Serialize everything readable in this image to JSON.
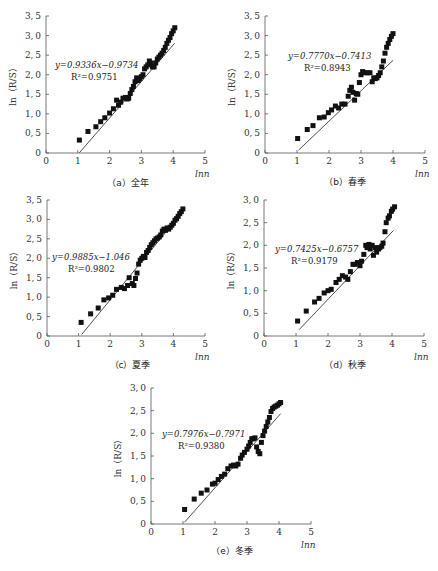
{
  "chart_data": [
    {
      "type": "scatter",
      "id": "a",
      "caption": "（a）全年",
      "xlabel": "lnn",
      "ylabel": "ln（R/S）",
      "xlim": [
        0,
        5
      ],
      "ylim": [
        0,
        3.5
      ],
      "xticks": [
        "0",
        "1",
        "2",
        "3",
        "4",
        "5"
      ],
      "yticks": [
        "0",
        "0.5",
        "1.0",
        "1.5",
        "2.0",
        "2.5",
        "3.0",
        "3.5"
      ],
      "equation": "y=0.9336x−0.9734",
      "r2": "R²=0.9751",
      "fit": {
        "slope": 0.9336,
        "intercept": -0.9734,
        "x_range": [
          1.05,
          4.05
        ]
      },
      "x": [
        1.05,
        1.32,
        1.57,
        1.72,
        1.85,
        2.0,
        2.12,
        2.22,
        2.28,
        2.35,
        2.42,
        2.5,
        2.55,
        2.6,
        2.65,
        2.7,
        2.75,
        2.8,
        2.85,
        2.9,
        2.95,
        3.0,
        3.05,
        3.1,
        3.15,
        3.2,
        3.25,
        3.3,
        3.35,
        3.4,
        3.45,
        3.5,
        3.55,
        3.6,
        3.65,
        3.7,
        3.75,
        3.8,
        3.85,
        3.9,
        3.95,
        4.0,
        4.05
      ],
      "y": [
        0.33,
        0.55,
        0.67,
        0.8,
        0.9,
        1.02,
        1.13,
        1.35,
        1.22,
        1.3,
        1.4,
        1.42,
        1.38,
        1.4,
        1.52,
        1.62,
        1.7,
        1.82,
        1.92,
        1.85,
        1.9,
        1.95,
        2.0,
        2.15,
        2.2,
        2.25,
        2.35,
        2.3,
        2.2,
        2.2,
        2.3,
        2.4,
        2.45,
        2.5,
        2.55,
        2.62,
        2.7,
        2.8,
        2.88,
        2.95,
        3.05,
        3.12,
        3.2
      ]
    },
    {
      "type": "scatter",
      "id": "b",
      "caption": "（b）春季",
      "xlabel": "lnn",
      "ylabel": "ln（R/S）",
      "xlim": [
        0,
        5
      ],
      "ylim": [
        0,
        3.5
      ],
      "xticks": [
        "0",
        "1",
        "2",
        "3",
        "4",
        "5"
      ],
      "yticks": [
        "0",
        "0.5",
        "1.0",
        "1.5",
        "2.0",
        "2.5",
        "3.0",
        "3.5"
      ],
      "equation": "y=0.7770x−0.7413",
      "r2": "R²=0.8943",
      "fit": {
        "slope": 0.777,
        "intercept": -0.7413,
        "x_range": [
          1.05,
          4.0
        ]
      },
      "x": [
        1.02,
        1.32,
        1.5,
        1.7,
        1.85,
        1.98,
        2.08,
        2.2,
        2.3,
        2.4,
        2.5,
        2.6,
        2.65,
        2.7,
        2.75,
        2.8,
        2.85,
        2.9,
        2.95,
        3.0,
        3.05,
        3.12,
        3.2,
        3.28,
        3.35,
        3.4,
        3.45,
        3.5,
        3.55,
        3.6,
        3.65,
        3.7,
        3.75,
        3.8,
        3.85,
        3.9,
        3.95,
        4.0
      ],
      "y": [
        0.37,
        0.6,
        0.7,
        0.9,
        0.92,
        1.03,
        1.1,
        1.2,
        1.15,
        1.25,
        1.25,
        1.45,
        1.6,
        1.68,
        1.55,
        1.35,
        1.52,
        1.5,
        1.8,
        2.0,
        2.08,
        2.05,
        2.05,
        2.05,
        1.82,
        1.92,
        1.9,
        1.92,
        1.98,
        2.05,
        2.2,
        2.35,
        2.55,
        2.7,
        2.8,
        2.9,
        2.98,
        3.05
      ]
    },
    {
      "type": "scatter",
      "id": "c",
      "caption": "（c）夏季",
      "xlabel": "lnn",
      "ylabel": "ln（R/S）",
      "xlim": [
        0,
        5
      ],
      "ylim": [
        0,
        3.5
      ],
      "xticks": [
        "0",
        "1",
        "2",
        "3",
        "4",
        "5"
      ],
      "yticks": [
        "0",
        "0.5",
        "1.0",
        "1.5",
        "2.0",
        "2.5",
        "3.0",
        "3.5"
      ],
      "equation": "y=0.9885x−1.046",
      "r2": "R²=0.9802",
      "fit": {
        "slope": 0.9885,
        "intercept": -1.046,
        "x_range": [
          1.1,
          4.3
        ]
      },
      "x": [
        1.08,
        1.38,
        1.62,
        1.8,
        1.95,
        2.08,
        2.2,
        2.35,
        2.45,
        2.55,
        2.6,
        2.7,
        2.75,
        2.8,
        2.85,
        2.9,
        2.95,
        3.0,
        3.05,
        3.1,
        3.15,
        3.2,
        3.25,
        3.3,
        3.35,
        3.4,
        3.45,
        3.5,
        3.55,
        3.6,
        3.65,
        3.7,
        3.75,
        3.8,
        3.85,
        3.9,
        3.95,
        4.0,
        4.05,
        4.1,
        4.15,
        4.2,
        4.25,
        4.3
      ],
      "y": [
        0.35,
        0.57,
        0.72,
        0.93,
        0.98,
        1.05,
        1.2,
        1.25,
        1.22,
        1.3,
        1.5,
        1.35,
        1.3,
        1.48,
        1.62,
        1.85,
        1.95,
        2.0,
        2.05,
        2.02,
        2.15,
        2.2,
        2.28,
        2.35,
        2.4,
        2.45,
        2.5,
        2.52,
        2.55,
        2.6,
        2.7,
        2.75,
        2.72,
        2.78,
        2.75,
        2.8,
        2.85,
        2.9,
        2.98,
        3.02,
        3.08,
        3.15,
        3.2,
        3.27
      ]
    },
    {
      "type": "scatter",
      "id": "d",
      "caption": "（d）秋季",
      "xlabel": "lnn",
      "ylabel": "ln（R/S）",
      "xlim": [
        0,
        5
      ],
      "ylim": [
        0,
        3.0
      ],
      "xticks": [
        "0",
        "1",
        "2",
        "3",
        "4",
        "5"
      ],
      "yticks": [
        "0",
        "0.5",
        "1.0",
        "1.5",
        "2.0",
        "2.5",
        "3.0"
      ],
      "equation": "y=0.7425x−0.6757",
      "r2": "R²=0.9179",
      "fit": {
        "slope": 0.7425,
        "intercept": -0.6757,
        "x_range": [
          1.1,
          4.05
        ]
      },
      "x": [
        1.05,
        1.32,
        1.58,
        1.72,
        1.88,
        2.0,
        2.1,
        2.25,
        2.35,
        2.45,
        2.55,
        2.62,
        2.7,
        2.78,
        2.85,
        2.92,
        3.0,
        3.05,
        3.12,
        3.18,
        3.22,
        3.28,
        3.32,
        3.38,
        3.42,
        3.48,
        3.52,
        3.58,
        3.62,
        3.68,
        3.72,
        3.78,
        3.82,
        3.88,
        3.92,
        3.98,
        4.02,
        4.08
      ],
      "y": [
        0.33,
        0.55,
        0.75,
        0.83,
        0.95,
        1.0,
        1.03,
        1.18,
        1.25,
        1.33,
        1.3,
        1.25,
        1.42,
        1.58,
        1.58,
        1.62,
        1.55,
        1.65,
        1.8,
        2.0,
        1.95,
        2.02,
        1.92,
        2.0,
        1.78,
        1.95,
        1.85,
        1.92,
        1.95,
        1.98,
        2.05,
        2.3,
        2.5,
        2.6,
        2.65,
        2.75,
        2.8,
        2.85
      ]
    },
    {
      "type": "scatter",
      "id": "e",
      "caption": "（e）冬季",
      "xlabel": "lnn",
      "ylabel": "ln（R/S）",
      "xlim": [
        0,
        5
      ],
      "ylim": [
        0,
        3.0
      ],
      "xticks": [
        "0",
        "1",
        "2",
        "3",
        "4",
        "5"
      ],
      "yticks": [
        "0",
        "0.5",
        "1.0",
        "1.5",
        "2.0",
        "2.5",
        "3.0"
      ],
      "equation": "y=0.7976x−0.7971",
      "r2": "R²=0.9380",
      "fit": {
        "slope": 0.7976,
        "intercept": -0.7971,
        "x_range": [
          1.05,
          4.05
        ]
      },
      "x": [
        1.05,
        1.35,
        1.57,
        1.75,
        1.92,
        2.0,
        2.1,
        2.2,
        2.3,
        2.4,
        2.5,
        2.58,
        2.65,
        2.72,
        2.8,
        2.85,
        2.92,
        3.0,
        3.05,
        3.1,
        3.15,
        3.2,
        3.25,
        3.3,
        3.35,
        3.4,
        3.45,
        3.5,
        3.55,
        3.6,
        3.65,
        3.7,
        3.75,
        3.8,
        3.85,
        3.9,
        3.95,
        4.0,
        4.05
      ],
      "y": [
        0.32,
        0.55,
        0.68,
        0.75,
        0.88,
        0.9,
        0.98,
        1.05,
        1.1,
        1.22,
        1.28,
        1.3,
        1.28,
        1.32,
        1.45,
        1.52,
        1.58,
        1.65,
        1.72,
        1.8,
        1.88,
        1.88,
        1.9,
        1.7,
        1.6,
        1.55,
        1.8,
        1.95,
        2.05,
        2.15,
        2.25,
        2.35,
        2.48,
        2.55,
        2.58,
        2.6,
        2.62,
        2.65,
        2.68
      ]
    }
  ]
}
